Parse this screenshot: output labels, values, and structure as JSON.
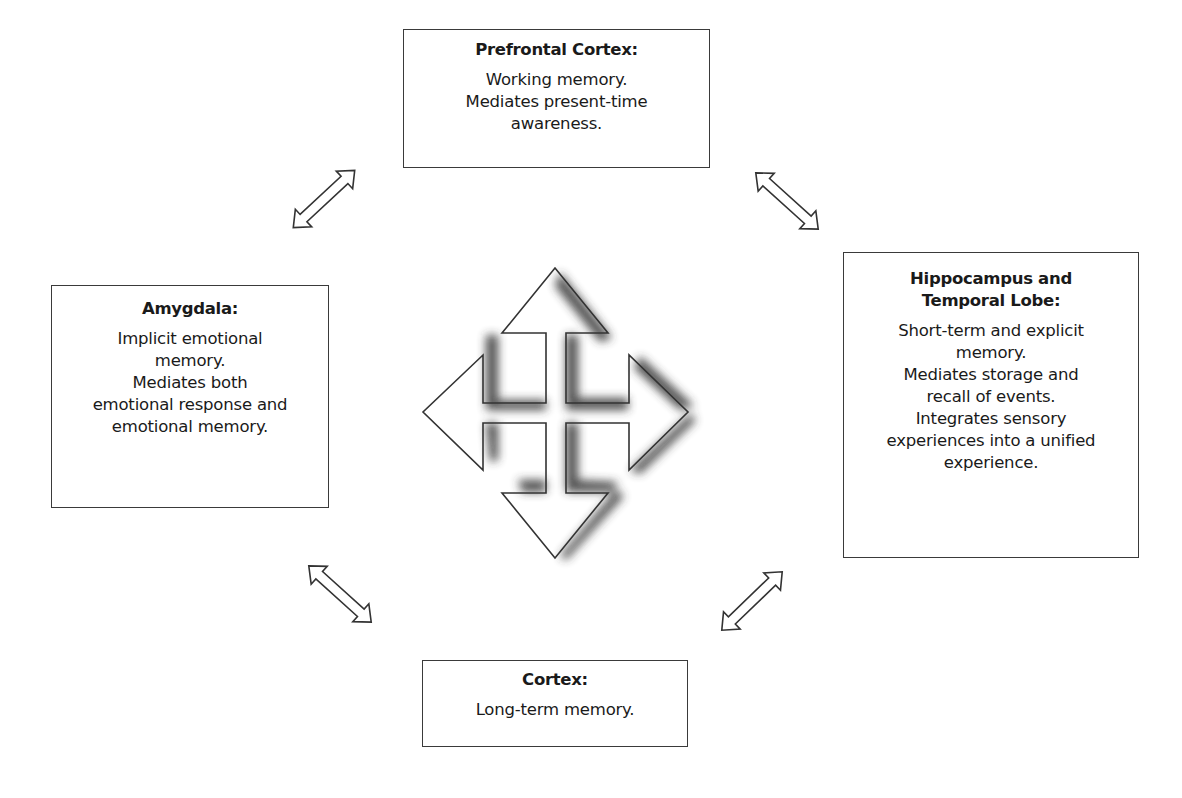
{
  "diagram": {
    "center": {
      "icon": "four-way-arrow-icon"
    },
    "boxes": {
      "prefrontal": {
        "title": "Prefrontal Cortex:",
        "lines": [
          "Working memory.",
          "Mediates present-time",
          "awareness."
        ]
      },
      "amygdala": {
        "title": "Amygdala:",
        "lines": [
          "Implicit emotional",
          "memory.",
          "Mediates both",
          "emotional response and",
          "emotional memory."
        ]
      },
      "hippocampus": {
        "title_lines": [
          "Hippocampus and",
          "Temporal Lobe:"
        ],
        "lines": [
          "Short-term and explicit",
          "memory.",
          "Mediates storage and",
          "recall of events.",
          "Integrates sensory",
          "experiences into a unified",
          "experience."
        ]
      },
      "cortex": {
        "title": "Cortex:",
        "lines": [
          "Long-term memory."
        ]
      }
    },
    "connectors": [
      {
        "from": "amygdala",
        "to": "prefrontal",
        "icon": "double-arrow-icon"
      },
      {
        "from": "prefrontal",
        "to": "hippocampus",
        "icon": "double-arrow-icon"
      },
      {
        "from": "amygdala",
        "to": "cortex",
        "icon": "double-arrow-icon"
      },
      {
        "from": "cortex",
        "to": "hippocampus",
        "icon": "double-arrow-icon"
      }
    ],
    "colors": {
      "stroke": "#3a3a3a",
      "shadow": "#333333",
      "background": "#ffffff"
    }
  }
}
